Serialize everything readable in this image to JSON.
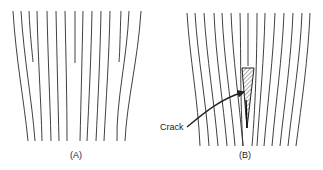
{
  "figure": {
    "panels": [
      {
        "id": "A",
        "label": "(A)",
        "description": "Undisturbed grain lines; a few short lines terminate midway"
      },
      {
        "id": "B",
        "label": "(B)",
        "description": "Grain lines diverging around a wedge-shaped crack"
      }
    ],
    "annotations": {
      "crack_label": "Crack"
    },
    "colors": {
      "line": "#2a2a2a",
      "background": "#ffffff",
      "hatch": "#555555"
    }
  }
}
